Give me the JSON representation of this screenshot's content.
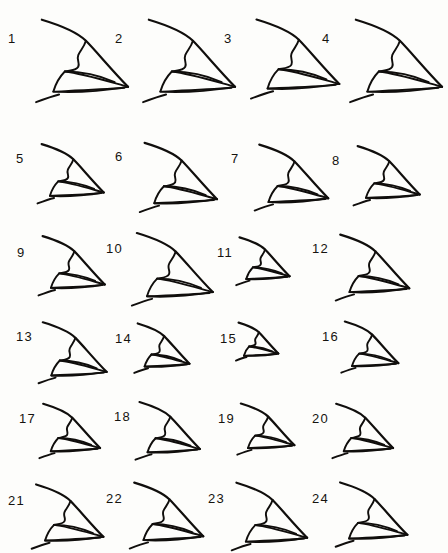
{
  "figure": {
    "background_color": "#fdfdfb",
    "ink_color": "#100e0c",
    "type": "specimen-plate",
    "columns": 4,
    "rows": 6,
    "total_specimens": 24
  },
  "chart_data": {
    "type": "table",
    "title": "",
    "xlabel": "",
    "ylabel": "",
    "categories": [
      "1",
      "2",
      "3",
      "4",
      "5",
      "6",
      "7",
      "8",
      "9",
      "10",
      "11",
      "12",
      "13",
      "14",
      "15",
      "16",
      "17",
      "18",
      "19",
      "20",
      "21",
      "22",
      "23",
      "24"
    ],
    "values": [
      100,
      100,
      96,
      100,
      72,
      84,
      80,
      72,
      72,
      88,
      58,
      80,
      74,
      60,
      46,
      62,
      66,
      70,
      62,
      66,
      78,
      80,
      82,
      78
    ]
  },
  "specimens": [
    {
      "label": "1",
      "x": 6,
      "y": 14,
      "nx": 2,
      "ny": 18,
      "scale": 1.0
    },
    {
      "label": "2",
      "x": 113,
      "y": 14,
      "nx": 2,
      "ny": 18,
      "scale": 1.0
    },
    {
      "label": "3",
      "x": 222,
      "y": 14,
      "nx": 2,
      "ny": 18,
      "scale": 0.96
    },
    {
      "label": "4",
      "x": 320,
      "y": 14,
      "nx": 2,
      "ny": 18,
      "scale": 1.0
    },
    {
      "label": "5",
      "x": 14,
      "y": 140,
      "nx": 2,
      "ny": 12,
      "scale": 0.72
    },
    {
      "label": "6",
      "x": 113,
      "y": 138,
      "nx": 2,
      "ny": 12,
      "scale": 0.84
    },
    {
      "label": "7",
      "x": 229,
      "y": 140,
      "nx": 2,
      "ny": 12,
      "scale": 0.8
    },
    {
      "label": "8",
      "x": 330,
      "y": 142,
      "nx": 2,
      "ny": 12,
      "scale": 0.72
    },
    {
      "label": "9",
      "x": 15,
      "y": 232,
      "nx": 2,
      "ny": 14,
      "scale": 0.72
    },
    {
      "label": "10",
      "x": 104,
      "y": 228,
      "nx": 2,
      "ny": 14,
      "scale": 0.88
    },
    {
      "label": "11",
      "x": 215,
      "y": 234,
      "nx": 2,
      "ny": 12,
      "scale": 0.58
    },
    {
      "label": "12",
      "x": 310,
      "y": 230,
      "nx": 2,
      "ny": 12,
      "scale": 0.8
    },
    {
      "label": "13",
      "x": 14,
      "y": 318,
      "nx": 2,
      "ny": 12,
      "scale": 0.74
    },
    {
      "label": "14",
      "x": 113,
      "y": 320,
      "nx": 2,
      "ny": 12,
      "scale": 0.6
    },
    {
      "label": "15",
      "x": 218,
      "y": 320,
      "nx": 2,
      "ny": 12,
      "scale": 0.46
    },
    {
      "label": "16",
      "x": 320,
      "y": 318,
      "nx": 2,
      "ny": 12,
      "scale": 0.62
    },
    {
      "label": "17",
      "x": 17,
      "y": 400,
      "nx": 2,
      "ny": 12,
      "scale": 0.66
    },
    {
      "label": "18",
      "x": 112,
      "y": 398,
      "nx": 2,
      "ny": 12,
      "scale": 0.7
    },
    {
      "label": "19",
      "x": 216,
      "y": 400,
      "nx": 2,
      "ny": 12,
      "scale": 0.62
    },
    {
      "label": "20",
      "x": 310,
      "y": 400,
      "nx": 2,
      "ny": 12,
      "scale": 0.66
    },
    {
      "label": "21",
      "x": 6,
      "y": 480,
      "nx": 2,
      "ny": 14,
      "scale": 0.78
    },
    {
      "label": "22",
      "x": 104,
      "y": 478,
      "nx": 2,
      "ny": 14,
      "scale": 0.8
    },
    {
      "label": "23",
      "x": 206,
      "y": 478,
      "nx": 2,
      "ny": 14,
      "scale": 0.82
    },
    {
      "label": "24",
      "x": 310,
      "y": 478,
      "nx": 2,
      "ny": 14,
      "scale": 0.78
    }
  ]
}
